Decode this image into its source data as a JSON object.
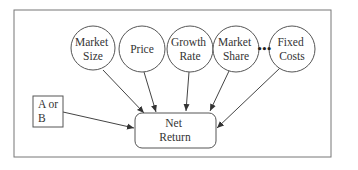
{
  "diagram": {
    "nodes": [
      {
        "id": "market-size",
        "lines": [
          "Market",
          "Size"
        ],
        "shape": "circle"
      },
      {
        "id": "price",
        "lines": [
          "Price"
        ],
        "shape": "circle"
      },
      {
        "id": "growth-rate",
        "lines": [
          "Growth",
          "Rate"
        ],
        "shape": "circle"
      },
      {
        "id": "market-share",
        "lines": [
          "Market",
          "Share"
        ],
        "shape": "circle"
      },
      {
        "id": "fixed-costs",
        "lines": [
          "Fixed",
          "Costs"
        ],
        "shape": "circle"
      },
      {
        "id": "decision",
        "lines": [
          "A or",
          "B"
        ],
        "shape": "rectangle"
      },
      {
        "id": "net-return",
        "lines": [
          "Net",
          "Return"
        ],
        "shape": "rounded-rectangle"
      }
    ],
    "ellipsis": "•••",
    "edges": [
      {
        "from": "market-size",
        "to": "net-return"
      },
      {
        "from": "price",
        "to": "net-return"
      },
      {
        "from": "growth-rate",
        "to": "net-return"
      },
      {
        "from": "market-share",
        "to": "net-return"
      },
      {
        "from": "fixed-costs",
        "to": "net-return"
      },
      {
        "from": "decision",
        "to": "net-return"
      }
    ]
  }
}
